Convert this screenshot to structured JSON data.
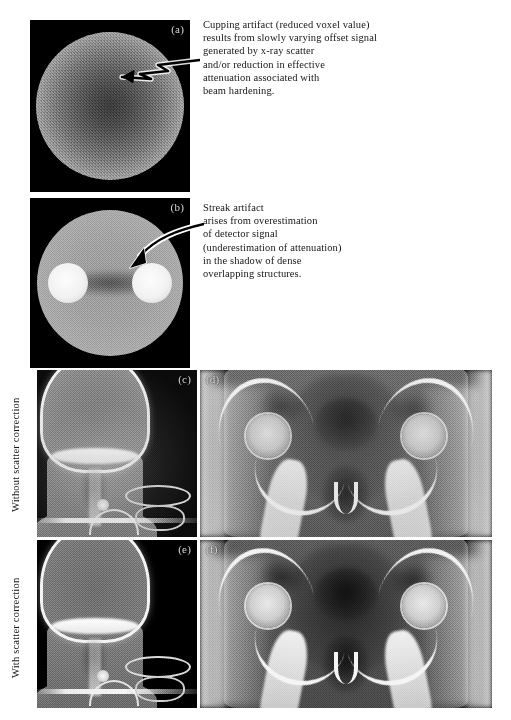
{
  "figure": {
    "panels": {
      "a": {
        "label": "(a)",
        "name": "cupping-artifact-phantom"
      },
      "b": {
        "label": "(b)",
        "name": "streak-artifact-phantom"
      },
      "c": {
        "label": "(c)",
        "name": "head-neck-without-correction"
      },
      "d": {
        "label": "(d)",
        "name": "pelvis-without-correction"
      },
      "e": {
        "label": "(e)",
        "name": "head-neck-with-correction"
      },
      "f": {
        "label": "(f)",
        "name": "pelvis-with-correction"
      }
    },
    "captions": {
      "cupping": "Cupping artifact (reduced voxel value)\nresults from slowly varying offset signal\ngenerated by x-ray scatter\nand/or reduction in effective\nattenuation associated with\nbeam hardening.",
      "streak": "Streak artifact\narises from overestimation\nof detector signal\n(underestimation of attenuation)\nin the shadow of dense\noverlapping structures."
    },
    "row_labels": {
      "without": "Without scatter correction",
      "with": "With scatter correction"
    },
    "colors": {
      "page_background": "#ffffff",
      "panel_background": "#000000",
      "panel_label": "#d8d8d8",
      "text": "#161616",
      "arrow": "#000000",
      "arrow_outline": "#ffffff"
    }
  }
}
